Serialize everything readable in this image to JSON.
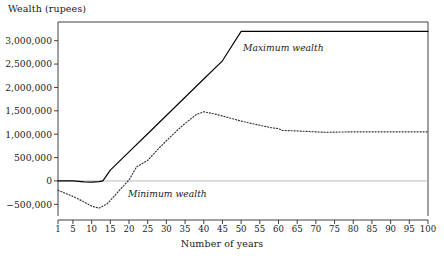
{
  "chart_data": {
    "type": "line",
    "title": "",
    "ylabel": "Wealth (rupees)",
    "xlabel": "Number of years",
    "xlim": [
      1,
      100
    ],
    "ylim": [
      -750000,
      3400000
    ],
    "grid": false,
    "legend_position": "inline-annotations",
    "zero_line": true,
    "ytick_labels": [
      "3,000,000",
      "2,500,000",
      "2,000,000",
      "1,500,000",
      "1,000,000",
      "500,000",
      "0",
      "−500,000"
    ],
    "ytick_values": [
      3000000,
      2500000,
      2000000,
      1500000,
      1000000,
      500000,
      0,
      -500000
    ],
    "xtick_labels": [
      "1",
      "5",
      "10",
      "15",
      "20",
      "25",
      "30",
      "35",
      "40",
      "45",
      "50",
      "55",
      "60",
      "65",
      "70",
      "75",
      "80",
      "85",
      "90",
      "95",
      "100"
    ],
    "xtick_values": [
      1,
      5,
      10,
      15,
      20,
      25,
      30,
      35,
      40,
      45,
      50,
      55,
      60,
      65,
      70,
      75,
      80,
      85,
      90,
      95,
      100
    ],
    "series": [
      {
        "name": "Maximum wealth",
        "style": "solid",
        "color": "#000000",
        "x": [
          1,
          5,
          8,
          10,
          12,
          13,
          15,
          20,
          25,
          30,
          35,
          40,
          45,
          50,
          55,
          60,
          65,
          70,
          75,
          80,
          85,
          90,
          95,
          100
        ],
        "values": [
          0,
          0,
          -20000,
          -25000,
          -15000,
          0,
          230000,
          620000,
          1010000,
          1400000,
          1790000,
          2180000,
          2570000,
          3200000,
          3200000,
          3200000,
          3200000,
          3200000,
          3200000,
          3200000,
          3200000,
          3200000,
          3200000,
          3200000
        ]
      },
      {
        "name": "Minimum wealth",
        "style": "dotted",
        "color": "#333333",
        "x": [
          1,
          5,
          8,
          10,
          12,
          14,
          16,
          18,
          20,
          22,
          25,
          28,
          30,
          33,
          35,
          38,
          40,
          43,
          45,
          50,
          55,
          58,
          60,
          61,
          65,
          70,
          73,
          75,
          80,
          85,
          90,
          95,
          100
        ],
        "values": [
          -200000,
          -330000,
          -450000,
          -540000,
          -580000,
          -500000,
          -330000,
          -150000,
          20000,
          300000,
          440000,
          700000,
          860000,
          1090000,
          1230000,
          1420000,
          1480000,
          1430000,
          1390000,
          1280000,
          1190000,
          1140000,
          1120000,
          1080000,
          1070000,
          1050000,
          1040000,
          1045000,
          1050000,
          1050000,
          1050000,
          1050000,
          1050000
        ]
      }
    ],
    "annotations": [
      {
        "text": "Maximum wealth",
        "series": "Maximum wealth"
      },
      {
        "text": "Minimum wealth",
        "series": "Minimum wealth"
      }
    ]
  }
}
